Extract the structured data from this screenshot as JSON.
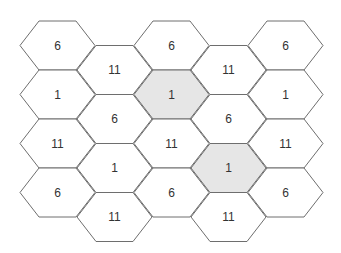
{
  "diagram": {
    "title": "",
    "colors": {
      "stroke": "#6e6e6e",
      "fill_default": "#ffffff",
      "fill_highlight": "#e6e6e6",
      "text": "#333333"
    },
    "geometry": {
      "hex_width": 75,
      "hex_height": 49,
      "inset": 19,
      "col_step": 57,
      "row_step": 49,
      "origin_x": 20,
      "origin_y": 21,
      "odd_col_offset_y": 24.5
    },
    "columns": [
      {
        "cells": [
          {
            "label": "6",
            "highlight": false
          },
          {
            "label": "1",
            "highlight": false
          },
          {
            "label": "11",
            "highlight": false
          },
          {
            "label": "6",
            "highlight": false
          }
        ]
      },
      {
        "cells": [
          {
            "label": "11",
            "highlight": false
          },
          {
            "label": "6",
            "highlight": false
          },
          {
            "label": "1",
            "highlight": false
          },
          {
            "label": "11",
            "highlight": false
          }
        ]
      },
      {
        "cells": [
          {
            "label": "6",
            "highlight": false
          },
          {
            "label": "1",
            "highlight": true
          },
          {
            "label": "11",
            "highlight": false
          },
          {
            "label": "6",
            "highlight": false
          }
        ]
      },
      {
        "cells": [
          {
            "label": "11",
            "highlight": false
          },
          {
            "label": "6",
            "highlight": false
          },
          {
            "label": "1",
            "highlight": true
          },
          {
            "label": "11",
            "highlight": false
          }
        ]
      },
      {
        "cells": [
          {
            "label": "6",
            "highlight": false
          },
          {
            "label": "1",
            "highlight": false
          },
          {
            "label": "11",
            "highlight": false
          },
          {
            "label": "6",
            "highlight": false
          }
        ]
      }
    ]
  }
}
